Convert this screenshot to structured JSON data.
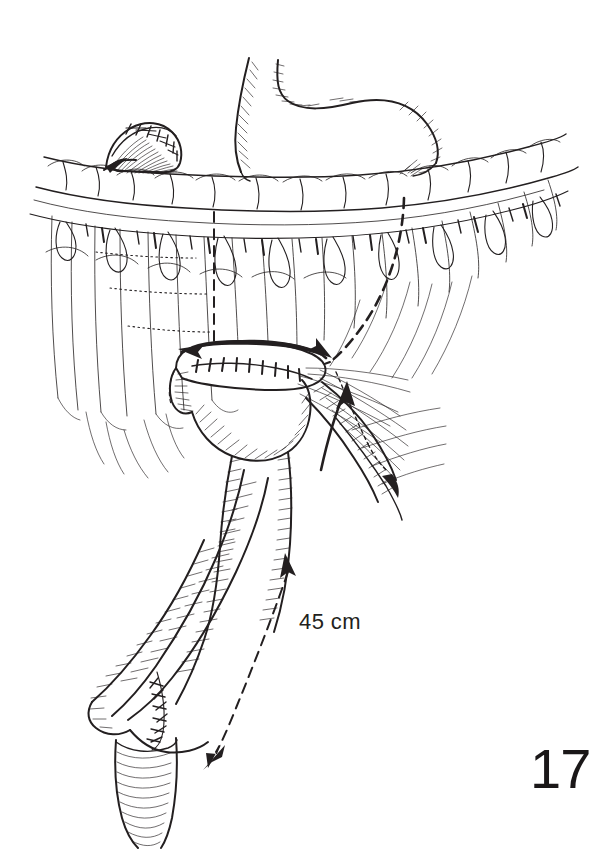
{
  "figure": {
    "number": "17",
    "domain": "surgical-line-illustration",
    "background_color": "#ffffff",
    "ink_color": "#231f20",
    "width": 607,
    "height": 852
  },
  "annotations": {
    "roux_limb_length": "45 cm"
  },
  "anatomy": {
    "items": [
      {
        "id": "gastric-remnant",
        "label": "gastric remnant"
      },
      {
        "id": "esophagus",
        "label": "esophagus"
      },
      {
        "id": "duodenal-stump",
        "label": "closed duodenal stump"
      },
      {
        "id": "transverse-colon",
        "label": "transverse colon"
      },
      {
        "id": "greater-omentum",
        "label": "greater omentum"
      },
      {
        "id": "roux-limb",
        "label": "Roux limb"
      },
      {
        "id": "biliopancreatic-limb",
        "label": "biliopancreatic limb"
      },
      {
        "id": "mesentery",
        "label": "small bowel mesentery"
      },
      {
        "id": "gastrojejunal-anastomosis",
        "label": "anastomosis suture line"
      },
      {
        "id": "jejunojejunostomy",
        "label": "jejunojejunostomy"
      },
      {
        "id": "efferent-limb",
        "label": "efferent jejunal limb"
      }
    ]
  },
  "markers": {
    "retrocolic-path": "dashed route behind transverse colon",
    "up-arrow": "direction of limb passage upward",
    "down-arrow": "distal direction of Roux limb",
    "measurement-line": "dashed 45 cm measurement"
  }
}
